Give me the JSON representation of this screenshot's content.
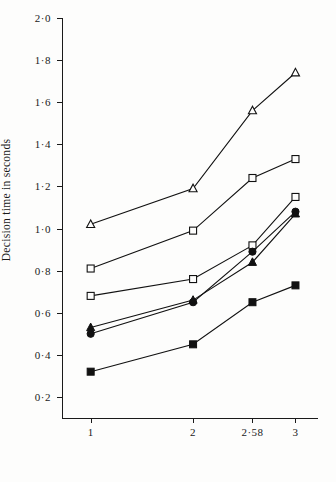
{
  "chart_data": {
    "type": "line",
    "title": "",
    "xlabel": "",
    "ylabel": "Decision time in seconds",
    "x_tick_labels": [
      "1",
      "2",
      "2·58",
      "3"
    ],
    "x_tick_values": [
      1,
      2,
      2.58,
      3
    ],
    "xlim": [
      0.72,
      3.22
    ],
    "y_tick_labels": [
      "0·2",
      "0·4",
      "0·6",
      "0·8",
      "1·0",
      "1·2",
      "1·4",
      "1·6",
      "1·8",
      "2·0"
    ],
    "y_tick_values": [
      0.2,
      0.4,
      0.6,
      0.8,
      1.0,
      1.2,
      1.4,
      1.6,
      1.8,
      2.0
    ],
    "ylim": [
      0.1,
      2.0
    ],
    "grid": false,
    "legend": "none",
    "series": [
      {
        "name": "open-triangle",
        "marker": "triangle-open",
        "x": [
          1,
          2,
          2.58,
          3
        ],
        "values": [
          1.02,
          1.19,
          1.56,
          1.74
        ]
      },
      {
        "name": "open-square",
        "marker": "square-open",
        "x": [
          1,
          2,
          2.58,
          3
        ],
        "values": [
          0.81,
          0.99,
          1.24,
          1.33
        ]
      },
      {
        "name": "open-square-lower",
        "marker": "square-open",
        "x": [
          1,
          2,
          2.58,
          3
        ],
        "values": [
          0.68,
          0.76,
          0.92,
          1.15
        ]
      },
      {
        "name": "filled-circle",
        "marker": "circle-filled",
        "x": [
          1,
          2,
          2.58,
          3
        ],
        "values": [
          0.5,
          0.65,
          0.89,
          1.08
        ]
      },
      {
        "name": "filled-triangle",
        "marker": "triangle-filled",
        "x": [
          1,
          2,
          2.58,
          3
        ],
        "values": [
          0.53,
          0.66,
          0.84,
          1.07
        ]
      },
      {
        "name": "filled-square",
        "marker": "square-filled",
        "x": [
          1,
          2,
          2.58,
          3
        ],
        "values": [
          0.32,
          0.45,
          0.65,
          0.73
        ]
      }
    ]
  }
}
